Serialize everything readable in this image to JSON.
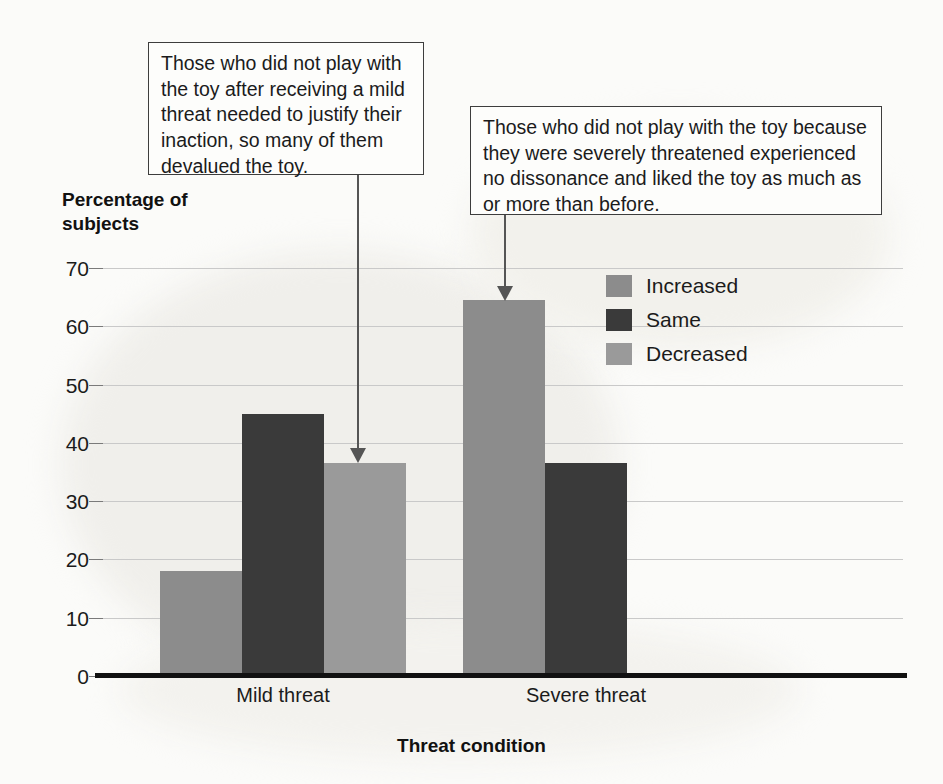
{
  "chart_data": {
    "type": "bar",
    "title": "",
    "xlabel": "Threat condition",
    "ylabel": "Percentage of subjects",
    "categories": [
      "Mild threat",
      "Severe threat"
    ],
    "series": [
      {
        "name": "Increased",
        "color": "#8c8c8c",
        "values": [
          18,
          64.5
        ]
      },
      {
        "name": "Same",
        "color": "#3a3a3a",
        "values": [
          45,
          36.5
        ]
      },
      {
        "name": "Decreased",
        "color": "#9a9a9a",
        "values": [
          36.5,
          0
        ]
      }
    ],
    "ylim": [
      0,
      70
    ],
    "yticks": [
      "0",
      "10",
      "20",
      "30",
      "40",
      "50",
      "60",
      "70"
    ],
    "ytick_values": [
      0,
      10,
      20,
      30,
      40,
      50,
      60,
      70
    ],
    "grid": true,
    "legend_position": "top-right"
  },
  "axis": {
    "y_title_line1": "Percentage of",
    "y_title_line2": "subjects",
    "x_title": "Threat condition"
  },
  "callouts": [
    {
      "id": "callout-mild",
      "text": "Those who did not play with the toy after receiving a mild threat needed to justify their inaction, so many of them devalued the toy.",
      "points_to": "Mild threat / Decreased bar"
    },
    {
      "id": "callout-severe",
      "text": "Those who did not play with the toy because they were severely threatened experienced no dissonance and liked the toy as much as or more than before.",
      "points_to": "Severe threat / Increased bar"
    }
  ]
}
